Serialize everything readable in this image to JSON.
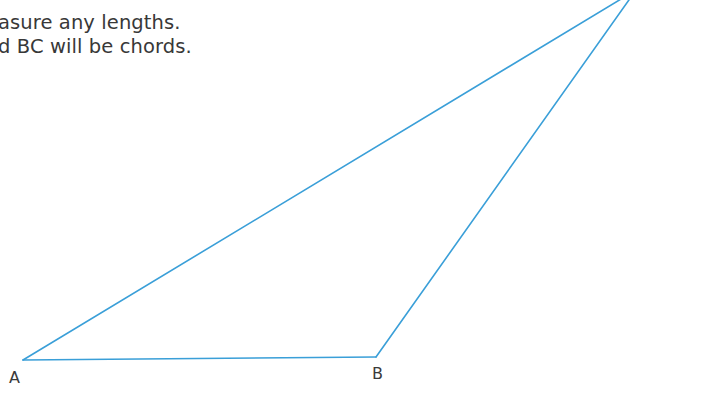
{
  "instructions": {
    "lines": [
      "asure any lengths.",
      "d BC will be chords."
    ]
  },
  "diagram": {
    "type": "triangle",
    "line_color": "#3a9fd8",
    "line_width": 1.6,
    "vertices": {
      "A": {
        "label": "A",
        "x": 23,
        "y": 360
      },
      "B": {
        "label": "B",
        "x": 376,
        "y": 357
      },
      "C": {
        "label": "",
        "x": 636,
        "y": -10
      }
    },
    "segments": [
      "AB",
      "BC",
      "CA"
    ]
  }
}
